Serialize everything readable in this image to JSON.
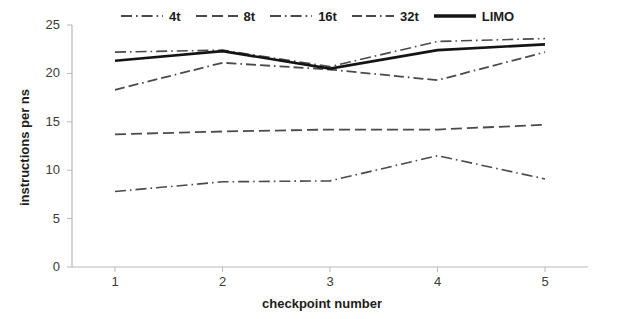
{
  "chart_data": {
    "type": "line",
    "title": "",
    "xlabel": "checkpoint number",
    "ylabel": "instructions per ns",
    "categories": [
      "1",
      "2",
      "3",
      "4",
      "5"
    ],
    "x": [
      1,
      2,
      3,
      4,
      5
    ],
    "xlim": [
      0.6,
      5.4
    ],
    "ylim": [
      0,
      25
    ],
    "yticks": [
      0,
      5,
      10,
      15,
      20,
      25
    ],
    "xticks": [
      1,
      2,
      3,
      4,
      5
    ],
    "grid": false,
    "legend_position": "top",
    "series": [
      {
        "name": "4t",
        "values": [
          7.8,
          8.8,
          8.9,
          11.5,
          9.1
        ],
        "style": "dash-dot",
        "width": 1.6,
        "color": "#4a4a4a"
      },
      {
        "name": "8t",
        "values": [
          13.7,
          14.0,
          14.2,
          14.2,
          14.7
        ],
        "style": "dashed",
        "width": 1.8,
        "color": "#4a4a4a"
      },
      {
        "name": "16t",
        "values": [
          22.2,
          22.4,
          20.7,
          23.3,
          23.6
        ],
        "style": "dash-dot",
        "width": 1.6,
        "color": "#4a4a4a"
      },
      {
        "name": "32t",
        "values": [
          18.3,
          21.1,
          20.4,
          19.3,
          22.2
        ],
        "style": "dash-dash-dot",
        "width": 1.8,
        "color": "#4a4a4a"
      },
      {
        "name": "LIMO",
        "values": [
          21.3,
          22.3,
          20.5,
          22.4,
          23.0
        ],
        "style": "solid",
        "width": 2.6,
        "color": "#141414"
      }
    ]
  },
  "legend": {
    "items": [
      {
        "label": "4t",
        "style": "dash-dot"
      },
      {
        "label": "8t",
        "style": "dashed"
      },
      {
        "label": "16t",
        "style": "dash-dot"
      },
      {
        "label": "32t",
        "style": "dash-dash-dot"
      },
      {
        "label": "LIMO",
        "style": "solid"
      }
    ]
  },
  "axes": {
    "y_title": "instructions per ns",
    "x_title": "checkpoint number",
    "y_ticks": [
      "25",
      "20",
      "15",
      "10",
      "5",
      "0"
    ],
    "x_ticks": [
      "1",
      "2",
      "3",
      "4",
      "5"
    ]
  },
  "colors": {
    "line": "#4a4a4a",
    "limo": "#141414",
    "axis": "#b8b8b8",
    "text": "#1c1c1c"
  }
}
